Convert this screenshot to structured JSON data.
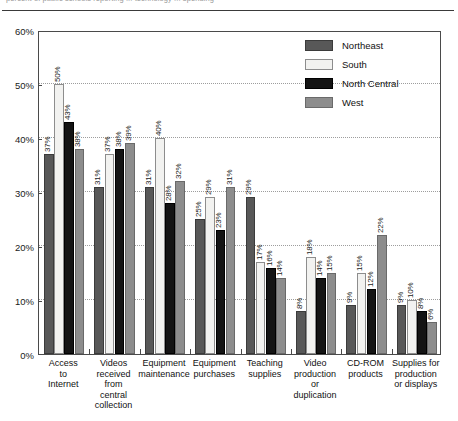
{
  "header": {
    "clipped_line": "percent of public schools reporting ... technology ... spending"
  },
  "chart_data": {
    "type": "bar",
    "title": "",
    "subtitle": "",
    "xlabel": "",
    "ylabel": "",
    "ylim": [
      0,
      60
    ],
    "yticks": [
      0,
      10,
      20,
      30,
      40,
      50,
      60
    ],
    "ytick_labels": [
      "0%",
      "10%",
      "20%",
      "30%",
      "40%",
      "50%",
      "60%"
    ],
    "grid": true,
    "grid_axis": "y",
    "legend_position": "top-right",
    "value_label_suffix": "%",
    "categories": [
      "Access\nto\nInternet",
      "Videos\nreceived\nfrom\ncentral\ncollection",
      "Equipment\nmaintenance",
      "Equipment\npurchases",
      "Teaching\nsupplies",
      "Video\nproduction\nor\nduplication",
      "CD-ROM\nproducts",
      "Supplies for\nproduction\nor displays"
    ],
    "series": [
      {
        "name": "Northeast",
        "color": "#585858",
        "values": [
          37,
          31,
          31,
          25,
          29,
          8,
          9,
          9
        ],
        "labels": [
          "37%",
          "31%",
          "31%",
          "25%",
          "29%",
          "8%",
          "9%",
          "9%"
        ]
      },
      {
        "name": "South",
        "color": "#f2f2f0",
        "values": [
          50,
          37,
          40,
          29,
          17,
          18,
          15,
          10
        ],
        "labels": [
          "50%",
          "37%",
          "40%",
          "29%",
          "17%",
          "18%",
          "15%",
          "10%"
        ]
      },
      {
        "name": "North Central",
        "color": "#141414",
        "values": [
          43,
          38,
          28,
          23,
          16,
          14,
          12,
          8
        ],
        "labels": [
          "43%",
          "38%",
          "28%",
          "23%",
          "16%",
          "14%",
          "12%",
          "8%"
        ]
      },
      {
        "name": "West",
        "color": "#8d8d8d",
        "values": [
          38,
          39,
          32,
          31,
          14,
          15,
          22,
          6
        ],
        "labels": [
          "38%",
          "39%",
          "32%",
          "31%",
          "14%",
          "15%",
          "22%",
          "6%"
        ]
      }
    ]
  }
}
